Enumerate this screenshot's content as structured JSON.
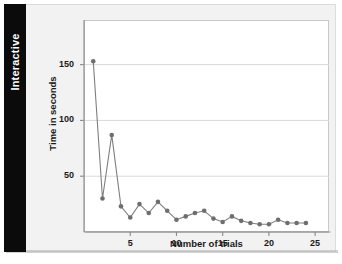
{
  "sidebar": {
    "tab_label": "Interactive"
  },
  "colors": {
    "tab_background": "#0b0b0b",
    "tab_text": "#ffffff",
    "page_background": "#f2f2f2",
    "panel_background": "#ffffff",
    "series_line": "#7f7f7f",
    "series_marker": "#6e6e6e",
    "gridline": "#d9d9d9",
    "axis": "#8a8a8a"
  },
  "chart_data": {
    "type": "line",
    "title": "",
    "subtitle": "",
    "xlabel": "Number of trials",
    "ylabel": "Time in seconds",
    "xlim": [
      0,
      26.5
    ],
    "ylim": [
      0,
      190
    ],
    "xticks": [
      5,
      10,
      15,
      20,
      25
    ],
    "yticks": [
      50,
      100,
      150
    ],
    "xtick_labels": [
      "5",
      "10",
      "15",
      "20",
      "25"
    ],
    "ytick_labels": [
      "50",
      "100",
      "150"
    ],
    "grid": "horizontal",
    "legend": "none",
    "markers": "filled-circle",
    "x": [
      1,
      2,
      3,
      4,
      5,
      6,
      7,
      8,
      9,
      10,
      11,
      12,
      13,
      14,
      15,
      16,
      17,
      18,
      19,
      20,
      21,
      22,
      23,
      24
    ],
    "values": [
      153,
      30,
      87,
      23,
      13,
      25,
      17,
      27,
      19,
      11,
      14,
      17,
      19,
      12,
      9,
      14,
      10,
      8,
      7,
      7,
      11,
      8,
      8,
      8
    ],
    "series": [
      {
        "name": "Time per trial",
        "values": [
          153,
          30,
          87,
          23,
          13,
          25,
          17,
          27,
          19,
          11,
          14,
          17,
          19,
          12,
          9,
          14,
          10,
          8,
          7,
          7,
          11,
          8,
          8,
          8
        ]
      }
    ]
  }
}
